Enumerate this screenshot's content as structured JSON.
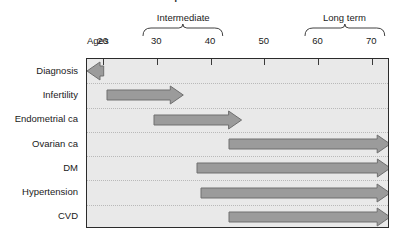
{
  "figure": {
    "title": "consequences of PCOS",
    "title_visible": "partially cut off at top edge"
  },
  "axis": {
    "name": "Ages",
    "ticks": [
      20,
      30,
      40,
      50,
      60,
      70
    ],
    "tick_labels": [
      "20",
      "30",
      "40",
      "50",
      "60",
      "70"
    ],
    "min": 16.9,
    "max": 73.3,
    "unit": "years"
  },
  "groups": [
    {
      "label": "Intermediate",
      "start": 30,
      "end": 40
    },
    {
      "label": "Long term",
      "start": 60,
      "end": 70
    }
  ],
  "chart_data": {
    "type": "bar",
    "title": "consequences of PCOS",
    "xlabel": "Ages",
    "ylabel": "",
    "xlim": [
      16.9,
      73.3
    ],
    "grid": "dotted row separators",
    "categories": [
      "Diagnosis",
      "Infertility",
      "Endometrial ca",
      "Ovarian ca",
      "DM",
      "Hypertension",
      "CVD"
    ],
    "bars": [
      {
        "label": "Diagnosis",
        "start_age": 20.0,
        "end_age": 16.9,
        "direction": "left"
      },
      {
        "label": "Infertility",
        "start_age": 20.6,
        "end_age": 34.8,
        "direction": "right"
      },
      {
        "label": "Endometrial ca",
        "start_age": 29.4,
        "end_age": 45.7,
        "direction": "right"
      },
      {
        "label": "Ovarian ca",
        "start_age": 43.3,
        "end_age": 73.3,
        "direction": "right"
      },
      {
        "label": "DM",
        "start_age": 37.3,
        "end_age": 73.3,
        "direction": "right"
      },
      {
        "label": "Hypertension",
        "start_age": 38.1,
        "end_age": 73.3,
        "direction": "right"
      },
      {
        "label": "CVD",
        "start_age": 43.3,
        "end_age": 73.3,
        "direction": "right"
      }
    ],
    "legend": [],
    "annotations": [
      "Intermediate (30-40)",
      "Long term (60-70)"
    ]
  },
  "colors": {
    "arrow_fill": "#9b9b9b",
    "arrow_stroke": "#6e6e6e",
    "plot_background": "#e9e9e9",
    "plot_border": "#2b2b2b",
    "row_separator": "#b9b9b9",
    "text": "#1a1a1a"
  }
}
